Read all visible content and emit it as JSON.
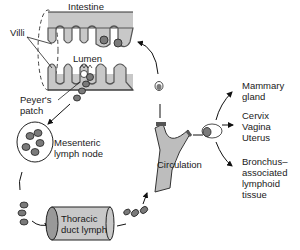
{
  "diagram": {
    "labels": {
      "intestine": "Intestine",
      "villi": "Villi",
      "lumen": "Lumen",
      "peyers_patch_line1": "Peyer's",
      "peyers_patch_line2": "patch",
      "mesenteric_line1": "Mesenteric",
      "mesenteric_line2": "lymph node",
      "thoracic_line1": "Thoracic",
      "thoracic_line2": "duct lymph",
      "circulation": "Circulation",
      "mammary_line1": "Mammary",
      "mammary_line2": "gland",
      "cervix_line1": "Cervix",
      "cervix_line2": "Vagina",
      "cervix_line3": "Uterus",
      "bronchus_line1": "Bronchus–",
      "bronchus_line2": "associated",
      "bronchus_line3": "lymphoid",
      "bronchus_line4": "tissue"
    },
    "colors": {
      "tissue_fill": "#c8c8c8",
      "cell_fill": "#7a7a7a",
      "stroke": "#222222"
    }
  }
}
